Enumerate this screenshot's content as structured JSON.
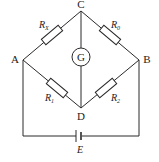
{
  "diagram": {
    "type": "circuit",
    "nodes": {
      "A": "A",
      "B": "B",
      "C": "C",
      "D": "D"
    },
    "resistors": [
      {
        "id": "rx",
        "label": "R",
        "sub": "X",
        "between": [
          "A",
          "C"
        ]
      },
      {
        "id": "r0",
        "label": "R",
        "sub": "0",
        "between": [
          "C",
          "B"
        ]
      },
      {
        "id": "r1",
        "label": "R",
        "sub": "1",
        "between": [
          "A",
          "D"
        ]
      },
      {
        "id": "r2",
        "label": "R",
        "sub": "2",
        "between": [
          "D",
          "B"
        ]
      }
    ],
    "galvanometer": {
      "label": "G",
      "between": [
        "C",
        "D"
      ]
    },
    "battery": {
      "label": "E",
      "between": [
        "A",
        "B"
      ]
    }
  }
}
